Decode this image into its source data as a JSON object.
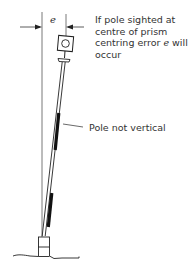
{
  "diagram": {
    "type": "survey-pole-centring-error",
    "symbol": "e",
    "annotations": [
      {
        "id": "sighting-note",
        "lines": [
          "If pole sighted at",
          "centre of prism",
          "centring error ",
          "occur"
        ],
        "line3_symbol": "e",
        "line3_suffix": " will"
      },
      {
        "id": "pole-note",
        "text": "Pole not vertical"
      }
    ],
    "colors": {
      "line": "#333333",
      "text": "#333333",
      "background": "#ffffff"
    }
  }
}
